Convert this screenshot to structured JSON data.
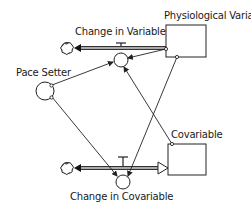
{
  "diagram": {
    "type": "stock-and-flow",
    "stocks": [
      {
        "id": "physiological-variable",
        "label": "Physiological Variable"
      },
      {
        "id": "covariable",
        "label": "Covariable"
      }
    ],
    "flows": [
      {
        "id": "change-in-variable",
        "label": "Change in Variable",
        "from": "cloud",
        "to": "physiological-variable"
      },
      {
        "id": "change-in-covariable",
        "label": "Change in Covariable",
        "from": "cloud",
        "to": "covariable"
      }
    ],
    "converters": [
      {
        "id": "pace-setter",
        "label": "Pace Setter"
      }
    ],
    "connectors": [
      {
        "from": "pace-setter",
        "to": "change-in-variable"
      },
      {
        "from": "pace-setter",
        "to": "change-in-covariable"
      },
      {
        "from": "physiological-variable",
        "to": "change-in-variable"
      },
      {
        "from": "physiological-variable",
        "to": "change-in-covariable"
      },
      {
        "from": "covariable",
        "to": "change-in-variable"
      }
    ]
  }
}
